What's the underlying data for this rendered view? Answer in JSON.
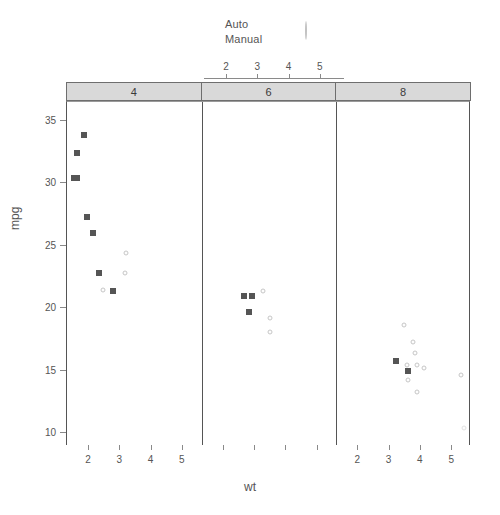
{
  "chart_data": {
    "type": "scatter",
    "title": "",
    "xlabel": "wt",
    "ylabel": "mpg",
    "xlim": [
      1.3,
      5.6
    ],
    "ylim": [
      9.0,
      36.5
    ],
    "xticks": [
      2,
      3,
      4,
      5
    ],
    "yticks": [
      10,
      15,
      20,
      25,
      30,
      35
    ],
    "grid": false,
    "legend_position": "top",
    "panel_variable": "cyl",
    "group_variable": "am",
    "legend": [
      {
        "label": "Auto",
        "marker": "open-circle",
        "color": "#c6c6c6"
      },
      {
        "label": "Manual",
        "marker": "filled-square",
        "color": "#555555"
      }
    ],
    "panels": [
      {
        "strip_label": "4",
        "series": [
          {
            "name": "Auto",
            "points": [
              {
                "x": 3.19,
                "y": 24.4
              },
              {
                "x": 3.15,
                "y": 22.8
              },
              {
                "x": 2.465,
                "y": 21.5
              }
            ]
          },
          {
            "name": "Manual",
            "points": [
              {
                "x": 1.835,
                "y": 33.9
              },
              {
                "x": 1.615,
                "y": 32.4
              },
              {
                "x": 1.513,
                "y": 30.4
              },
              {
                "x": 1.615,
                "y": 30.4
              },
              {
                "x": 1.935,
                "y": 27.3
              },
              {
                "x": 2.14,
                "y": 26.0
              },
              {
                "x": 2.32,
                "y": 22.8
              },
              {
                "x": 2.78,
                "y": 21.4
              }
            ]
          }
        ]
      },
      {
        "strip_label": "6",
        "series": [
          {
            "name": "Auto",
            "points": [
              {
                "x": 3.215,
                "y": 21.4
              },
              {
                "x": 3.44,
                "y": 19.2
              },
              {
                "x": 3.46,
                "y": 18.1
              }
            ]
          },
          {
            "name": "Manual",
            "points": [
              {
                "x": 2.62,
                "y": 21.0
              },
              {
                "x": 2.875,
                "y": 21.0
              },
              {
                "x": 2.77,
                "y": 19.7
              }
            ]
          }
        ]
      },
      {
        "strip_label": "8",
        "series": [
          {
            "name": "Auto",
            "points": [
              {
                "x": 3.44,
                "y": 18.7
              },
              {
                "x": 3.73,
                "y": 17.3
              },
              {
                "x": 3.78,
                "y": 16.4
              },
              {
                "x": 4.07,
                "y": 15.2
              },
              {
                "x": 3.845,
                "y": 15.5
              },
              {
                "x": 3.52,
                "y": 15.5
              },
              {
                "x": 3.57,
                "y": 15.0
              },
              {
                "x": 3.57,
                "y": 14.3
              },
              {
                "x": 3.84,
                "y": 13.3
              },
              {
                "x": 5.25,
                "y": 14.7
              },
              {
                "x": 5.345,
                "y": 10.4
              }
            ]
          },
          {
            "name": "Manual",
            "points": [
              {
                "x": 3.17,
                "y": 15.8
              },
              {
                "x": 3.57,
                "y": 15.0
              }
            ]
          }
        ]
      }
    ]
  }
}
